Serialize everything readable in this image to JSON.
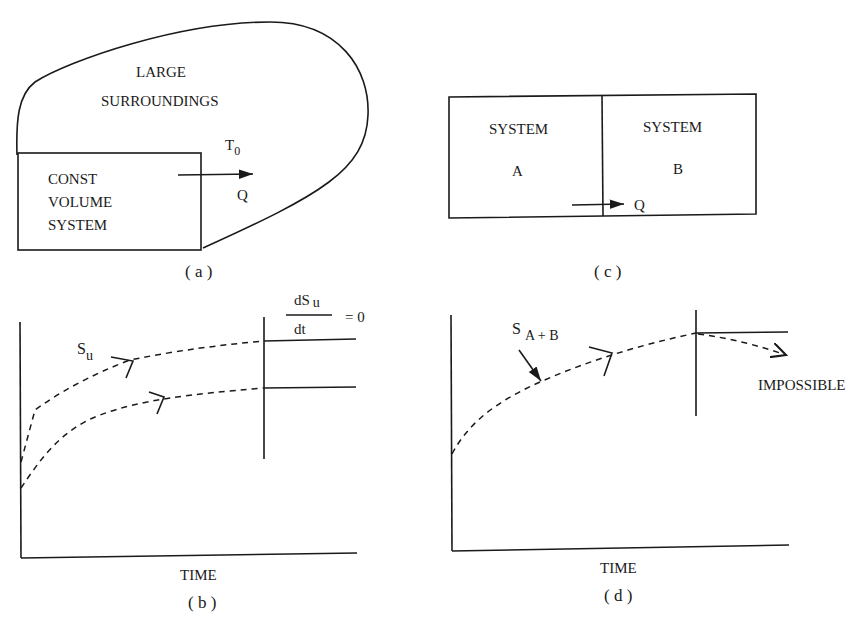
{
  "panels": {
    "a": {
      "caption": "( a )",
      "surroundings_line1": "LARGE",
      "surroundings_line2": "SURROUNDINGS",
      "temperature_label": "T",
      "temperature_sub": "0",
      "heat_label": "Q",
      "system_line1": "CONST",
      "system_line2": "VOLUME",
      "system_line3": "SYSTEM"
    },
    "b": {
      "caption": "( b )",
      "xlabel": "TIME",
      "curve_label": "S",
      "curve_label_sub": "u",
      "deriv_num": "dS",
      "deriv_num_sub": "u",
      "deriv_den": "dt",
      "deriv_eq": "= 0"
    },
    "c": {
      "caption": "( c )",
      "system_a_line1": "SYSTEM",
      "system_a_line2": "A",
      "system_b_line1": "SYSTEM",
      "system_b_line2": "B",
      "heat_label": "Q"
    },
    "d": {
      "caption": "( d )",
      "xlabel": "TIME",
      "curve_label": "S",
      "curve_label_sub": "A + B",
      "annotation": "IMPOSSIBLE"
    }
  },
  "colors": {
    "ink": "#1a1a1a",
    "background": "#ffffff"
  }
}
